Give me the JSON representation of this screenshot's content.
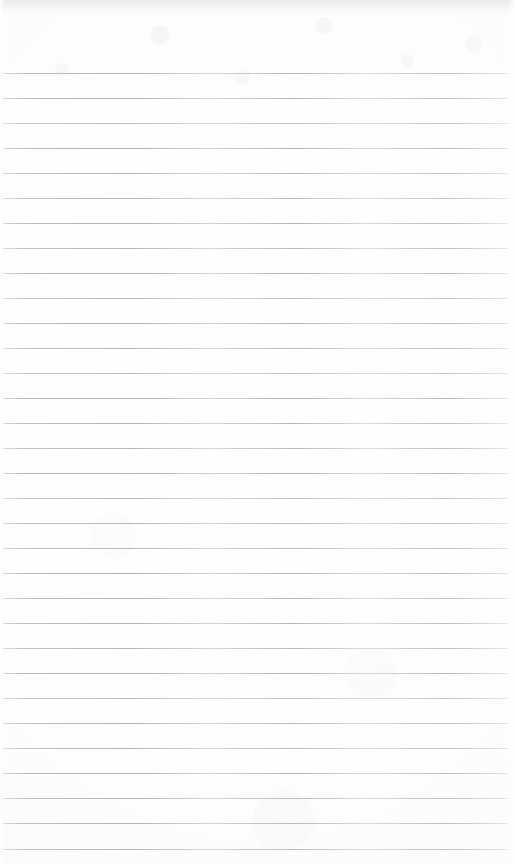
{
  "page": {
    "kind": "scanned-blank-ruled-notebook-page",
    "width": 515,
    "height": 864,
    "has_text": false,
    "has_handwriting": false,
    "has_margin_rule": false,
    "paper_color": "#fdfdfd",
    "rule_color": "#b9bdc3",
    "top_wash_color": "#bcc0c6"
  },
  "ruling": {
    "line_count": 32,
    "first_line_y": 73,
    "spacing_px": 25,
    "last_line_y": 849,
    "line_thickness_px": 1,
    "line_start_x": 2,
    "line_end_x": 508,
    "lines_y": [
      73,
      98,
      123,
      148,
      173,
      198,
      223,
      248,
      273,
      298,
      323,
      348,
      373,
      398,
      423,
      448,
      473,
      498,
      523,
      548,
      573,
      598,
      623,
      648,
      673,
      698,
      723,
      748,
      773,
      798,
      823,
      849
    ],
    "line_opacity": [
      0.86,
      0.92,
      0.8,
      0.95,
      0.88,
      0.82,
      0.93,
      0.87,
      0.9,
      0.84,
      0.95,
      0.88,
      0.81,
      0.93,
      0.9,
      0.86,
      0.94,
      0.83,
      0.9,
      0.88,
      0.95,
      0.85,
      0.91,
      0.87,
      0.93,
      0.82,
      0.9,
      0.88,
      0.94,
      0.86,
      0.9,
      0.84
    ]
  },
  "content": {
    "text_blocks": [],
    "note": ""
  }
}
